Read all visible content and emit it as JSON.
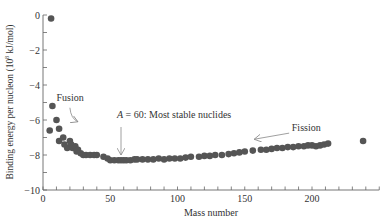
{
  "chart_data": {
    "type": "scatter",
    "title": "",
    "xlabel": "Mass number",
    "ylabel": "Binding energy per nucleon (10^8 kJ/mol)",
    "ylabel_parts": {
      "pre": "Binding energy per nucleon (10",
      "sup": "8",
      "post": " kJ/mol)"
    },
    "xlim": [
      0,
      250
    ],
    "ylim": [
      -10,
      0
    ],
    "x_ticks": [
      0,
      50,
      100,
      150,
      200
    ],
    "x_minor_step": 10,
    "y_ticks": [
      0,
      -2,
      -4,
      -6,
      -8,
      -10
    ],
    "y_tick_labels": [
      "0",
      "−2",
      "−4",
      "−6",
      "−8",
      "−10"
    ],
    "y_minor_step": 1,
    "grid": false,
    "legend": null,
    "marker_color": "#555555",
    "series": [
      {
        "name": "Nuclides",
        "points": [
          [
            6,
            -0.2
          ],
          [
            7,
            -5.2
          ],
          [
            5,
            -6.6
          ],
          [
            10,
            -6.0
          ],
          [
            12,
            -6.5
          ],
          [
            12,
            -7.2
          ],
          [
            15,
            -7.0
          ],
          [
            16,
            -7.4
          ],
          [
            18,
            -7.6
          ],
          [
            20,
            -7.2
          ],
          [
            21,
            -7.4
          ],
          [
            22,
            -7.6
          ],
          [
            24,
            -7.5
          ],
          [
            25,
            -7.8
          ],
          [
            26,
            -7.7
          ],
          [
            28,
            -7.9
          ],
          [
            30,
            -8.0
          ],
          [
            32,
            -8.0
          ],
          [
            35,
            -8.0
          ],
          [
            38,
            -8.0
          ],
          [
            40,
            -8.0
          ],
          [
            45,
            -8.1
          ],
          [
            48,
            -8.2
          ],
          [
            50,
            -8.3
          ],
          [
            53,
            -8.3
          ],
          [
            56,
            -8.3
          ],
          [
            58,
            -8.3
          ],
          [
            60,
            -8.3
          ],
          [
            62,
            -8.3
          ],
          [
            65,
            -8.3
          ],
          [
            68,
            -8.25
          ],
          [
            70,
            -8.25
          ],
          [
            74,
            -8.25
          ],
          [
            78,
            -8.25
          ],
          [
            82,
            -8.25
          ],
          [
            86,
            -8.2
          ],
          [
            90,
            -8.25
          ],
          [
            94,
            -8.2
          ],
          [
            98,
            -8.2
          ],
          [
            102,
            -8.2
          ],
          [
            106,
            -8.15
          ],
          [
            110,
            -8.1
          ],
          [
            116,
            -8.1
          ],
          [
            120,
            -8.05
          ],
          [
            124,
            -8.05
          ],
          [
            128,
            -8.0
          ],
          [
            133,
            -8.0
          ],
          [
            138,
            -7.95
          ],
          [
            142,
            -7.9
          ],
          [
            146,
            -7.85
          ],
          [
            150,
            -7.8
          ],
          [
            156,
            -7.75
          ],
          [
            162,
            -7.7
          ],
          [
            166,
            -7.7
          ],
          [
            170,
            -7.65
          ],
          [
            174,
            -7.6
          ],
          [
            178,
            -7.6
          ],
          [
            182,
            -7.55
          ],
          [
            186,
            -7.55
          ],
          [
            190,
            -7.5
          ],
          [
            194,
            -7.5
          ],
          [
            197,
            -7.45
          ],
          [
            200,
            -7.45
          ],
          [
            203,
            -7.5
          ],
          [
            206,
            -7.45
          ],
          [
            209,
            -7.4
          ],
          [
            212,
            -7.35
          ],
          [
            238,
            -7.2
          ]
        ]
      }
    ],
    "annotations": [
      {
        "text": "Fusion",
        "x": 10,
        "y": -4.9,
        "arrow_from": [
          20,
          -5.3
        ],
        "arrow_to": [
          26,
          -6.1
        ]
      },
      {
        "text_italic": "A",
        "text": " = 60:  Most stable nuclides",
        "x": 55,
        "y": -5.9,
        "arrow_from": [
          58,
          -6.4
        ],
        "arrow_to": [
          58,
          -8.0
        ]
      },
      {
        "text": "Fission",
        "x": 185,
        "y": -6.6,
        "arrow_from": [
          183,
          -6.75
        ],
        "arrow_to": [
          157,
          -7.1
        ]
      }
    ]
  }
}
